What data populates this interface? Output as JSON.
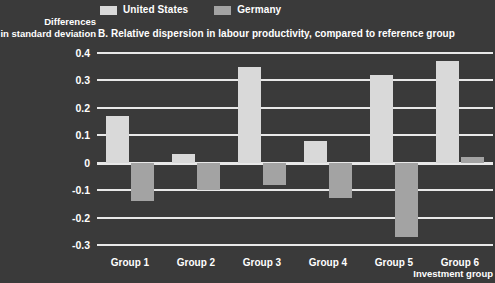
{
  "chart_data": {
    "type": "bar",
    "title": "B. Relative dispersion in labour productivity, compared to reference group",
    "xlabel": "Investment group",
    "ylabel": "Differences in standard deviation",
    "ylabel_line1": "Differences",
    "ylabel_line2": "in standard deviation",
    "categories": [
      "Group 1",
      "Group 2",
      "Group 3",
      "Group 4",
      "Group 5",
      "Group 6"
    ],
    "series": [
      {
        "name": "United States",
        "color": "#d9d9d9",
        "values": [
          0.17,
          0.03,
          0.35,
          0.08,
          0.32,
          0.37
        ]
      },
      {
        "name": "Germany",
        "color": "#a3a3a3",
        "values": [
          -0.14,
          -0.1,
          -0.08,
          -0.13,
          -0.27,
          0.02
        ]
      }
    ],
    "yticks": [
      0.4,
      0.3,
      0.2,
      0.1,
      0,
      -0.1,
      -0.2,
      -0.3
    ],
    "ytick_labels": [
      "0.4",
      "0.3",
      "0.2",
      "0.1",
      "0",
      "-0.1",
      "-0.2",
      "-0.3"
    ],
    "ylim": [
      -0.3,
      0.4
    ],
    "grid": true,
    "legend_position": "top",
    "background_color": "#3a3a3a",
    "gridline_color": "#e8e8e8",
    "text_color": "#ffffff"
  }
}
